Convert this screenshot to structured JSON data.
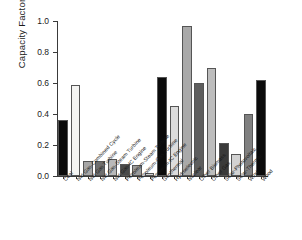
{
  "chart_data": {
    "type": "bar",
    "title": "",
    "xlabel": "",
    "ylabel": "Capacity Factor",
    "ylim": [
      0.0,
      1.0
    ],
    "ytick_labels": [
      "0.0",
      "0.2",
      "0.4",
      "0.6",
      "0.8",
      "1.0"
    ],
    "ytick_values": [
      0.0,
      0.2,
      0.4,
      0.6,
      0.8,
      1.0
    ],
    "grid": false,
    "legend": "none",
    "categories": [
      "Coal",
      "Nat Gas-Combined Cycle",
      "Nat Gas Turbine",
      "Nat Gas-Steam Turbine",
      "Nat Gas-IC Engine",
      "Petroleum-Steam Turbine",
      "Petroleum-Gas Turbine",
      "Petroleum-IC Engine",
      "Geothermal",
      "Hydroelectric",
      "Nuclear",
      "Other Biomass",
      "Other Gas",
      "Solar-Photovoltaic",
      "Solar-Thermal",
      "Wind",
      "Wood"
    ],
    "values": [
      0.36,
      0.59,
      0.095,
      0.1,
      0.11,
      0.08,
      0.07,
      0.02,
      0.64,
      0.45,
      0.965,
      0.6,
      0.7,
      0.21,
      0.145,
      0.4,
      0.62
    ],
    "bar_colors": [
      "#0b0b0b",
      "#f4f4f2",
      "#a6a6a6",
      "#6f6f6f",
      "#b9b9b9",
      "#4a4a4a",
      "#9a9a9a",
      "#cfcfcf",
      "#0b0b0b",
      "#dcdcdc",
      "#a9a9a9",
      "#5e5e5e",
      "#bdbdbd",
      "#3a3a3a",
      "#d2d2d2",
      "#808080",
      "#0b0b0b"
    ]
  }
}
